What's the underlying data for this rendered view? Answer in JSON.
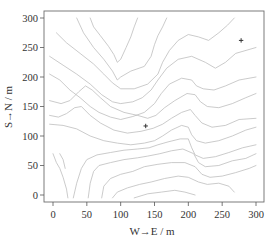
{
  "chart_data": {
    "type": "contour",
    "title": "",
    "xlabel": "W→E / m",
    "ylabel": "S→N / m",
    "xlim": [
      -12,
      310
    ],
    "ylim": [
      -12,
      312
    ],
    "xticks": [
      0,
      50,
      100,
      150,
      200,
      250,
      300
    ],
    "yticks": [
      0,
      50,
      100,
      150,
      200,
      250,
      300
    ],
    "xtick_labels": [
      "0",
      "50",
      "100",
      "150",
      "200",
      "250",
      "300"
    ],
    "ytick_labels": [
      "0",
      "50",
      "100",
      "150",
      "200",
      "250",
      "300"
    ],
    "grid": false,
    "legend": null,
    "line_color": "#b9b9b9",
    "markers": [
      {
        "symbol": "plus",
        "x": 278,
        "y": 262,
        "color": "#333333"
      },
      {
        "symbol": "plus",
        "x": 137,
        "y": 117,
        "color": "#333333"
      }
    ],
    "contours": [
      [
        [
          55,
          300
        ],
        [
          60,
          285
        ],
        [
          70,
          270
        ],
        [
          82,
          252
        ],
        [
          90,
          238
        ],
        [
          95,
          225
        ],
        [
          100,
          230
        ],
        [
          108,
          250
        ],
        [
          115,
          268
        ],
        [
          120,
          285
        ],
        [
          125,
          300
        ]
      ],
      [
        [
          35,
          300
        ],
        [
          45,
          275
        ],
        [
          60,
          250
        ],
        [
          75,
          230
        ],
        [
          88,
          210
        ],
        [
          95,
          195
        ],
        [
          100,
          200
        ],
        [
          115,
          210
        ],
        [
          135,
          218
        ],
        [
          145,
          235
        ],
        [
          150,
          255
        ],
        [
          155,
          270
        ],
        [
          162,
          285
        ],
        [
          168,
          300
        ]
      ],
      [
        [
          5,
          275
        ],
        [
          20,
          258
        ],
        [
          40,
          240
        ],
        [
          60,
          222
        ],
        [
          75,
          205
        ],
        [
          88,
          190
        ],
        [
          100,
          180
        ],
        [
          120,
          180
        ],
        [
          140,
          188
        ],
        [
          155,
          205
        ],
        [
          162,
          225
        ],
        [
          172,
          245
        ],
        [
          185,
          262
        ],
        [
          200,
          272
        ],
        [
          215,
          268
        ],
        [
          230,
          262
        ],
        [
          245,
          275
        ],
        [
          258,
          288
        ],
        [
          268,
          300
        ]
      ],
      [
        [
          -5,
          235
        ],
        [
          15,
          220
        ],
        [
          35,
          205
        ],
        [
          55,
          188
        ],
        [
          72,
          170
        ],
        [
          88,
          158
        ],
        [
          100,
          155
        ],
        [
          118,
          158
        ],
        [
          132,
          165
        ],
        [
          145,
          178
        ],
        [
          155,
          195
        ],
        [
          168,
          215
        ],
        [
          185,
          230
        ],
        [
          205,
          235
        ],
        [
          225,
          225
        ],
        [
          240,
          215
        ],
        [
          255,
          225
        ],
        [
          270,
          240
        ],
        [
          300,
          250
        ]
      ],
      [
        [
          -5,
          205
        ],
        [
          10,
          195
        ],
        [
          25,
          178
        ],
        [
          40,
          165
        ],
        [
          55,
          150
        ],
        [
          68,
          140
        ],
        [
          85,
          132
        ],
        [
          100,
          128
        ],
        [
          118,
          133
        ],
        [
          135,
          140
        ],
        [
          150,
          155
        ],
        [
          160,
          172
        ],
        [
          172,
          188
        ],
        [
          190,
          198
        ],
        [
          205,
          195
        ],
        [
          212,
          185
        ],
        [
          222,
          180
        ],
        [
          238,
          178
        ],
        [
          255,
          185
        ],
        [
          275,
          195
        ],
        [
          300,
          200
        ]
      ],
      [
        [
          -5,
          160
        ],
        [
          12,
          155
        ],
        [
          25,
          160
        ],
        [
          38,
          175
        ],
        [
          48,
          185
        ],
        [
          58,
          178
        ],
        [
          70,
          165
        ],
        [
          85,
          150
        ],
        [
          105,
          140
        ],
        [
          125,
          135
        ],
        [
          140,
          130
        ],
        [
          152,
          135
        ],
        [
          165,
          148
        ],
        [
          180,
          160
        ],
        [
          198,
          172
        ],
        [
          210,
          170
        ],
        [
          218,
          158
        ],
        [
          228,
          150
        ],
        [
          245,
          148
        ],
        [
          265,
          155
        ],
        [
          285,
          165
        ],
        [
          300,
          172
        ]
      ],
      [
        [
          -5,
          135
        ],
        [
          8,
          132
        ],
        [
          20,
          138
        ],
        [
          32,
          148
        ],
        [
          42,
          150
        ],
        [
          55,
          135
        ],
        [
          70,
          122
        ],
        [
          90,
          110
        ],
        [
          110,
          105
        ],
        [
          130,
          108
        ],
        [
          148,
          113
        ],
        [
          162,
          120
        ],
        [
          175,
          130
        ],
        [
          190,
          140
        ],
        [
          203,
          145
        ],
        [
          210,
          135
        ],
        [
          220,
          122
        ],
        [
          235,
          115
        ],
        [
          255,
          118
        ],
        [
          275,
          128
        ],
        [
          300,
          130
        ]
      ],
      [
        [
          -5,
          120
        ],
        [
          15,
          118
        ],
        [
          35,
          112
        ],
        [
          55,
          100
        ],
        [
          75,
          92
        ],
        [
          95,
          88
        ],
        [
          115,
          85
        ],
        [
          135,
          88
        ],
        [
          150,
          92
        ],
        [
          162,
          100
        ],
        [
          175,
          110
        ],
        [
          190,
          118
        ],
        [
          200,
          115
        ],
        [
          205,
          102
        ],
        [
          212,
          92
        ],
        [
          225,
          88
        ],
        [
          245,
          92
        ],
        [
          265,
          100
        ],
        [
          285,
          110
        ],
        [
          300,
          115
        ]
      ],
      [
        [
          30,
          -5
        ],
        [
          35,
          20
        ],
        [
          42,
          45
        ],
        [
          50,
          60
        ],
        [
          65,
          68
        ],
        [
          85,
          72
        ],
        [
          105,
          76
        ],
        [
          125,
          78
        ],
        [
          142,
          80
        ],
        [
          155,
          85
        ],
        [
          170,
          90
        ],
        [
          188,
          95
        ],
        [
          200,
          95
        ],
        [
          205,
          80
        ],
        [
          210,
          68
        ],
        [
          222,
          62
        ],
        [
          240,
          65
        ],
        [
          260,
          72
        ],
        [
          280,
          80
        ],
        [
          300,
          85
        ]
      ],
      [
        [
          52,
          -5
        ],
        [
          55,
          20
        ],
        [
          60,
          40
        ],
        [
          68,
          50
        ],
        [
          85,
          55
        ],
        [
          105,
          60
        ],
        [
          125,
          63
        ],
        [
          140,
          66
        ],
        [
          158,
          70
        ],
        [
          175,
          75
        ],
        [
          192,
          78
        ],
        [
          208,
          70
        ],
        [
          215,
          55
        ],
        [
          225,
          48
        ],
        [
          245,
          50
        ],
        [
          265,
          58
        ],
        [
          285,
          62
        ],
        [
          300,
          70
        ]
      ],
      [
        [
          72,
          -5
        ],
        [
          75,
          15
        ],
        [
          85,
          28
        ],
        [
          100,
          35
        ],
        [
          118,
          40
        ],
        [
          135,
          48
        ],
        [
          155,
          52
        ],
        [
          175,
          55
        ],
        [
          195,
          55
        ],
        [
          210,
          48
        ],
        [
          220,
          35
        ],
        [
          232,
          30
        ],
        [
          250,
          32
        ],
        [
          270,
          38
        ],
        [
          290,
          45
        ],
        [
          300,
          50
        ]
      ],
      [
        [
          88,
          -5
        ],
        [
          95,
          5
        ],
        [
          110,
          12
        ],
        [
          128,
          18
        ],
        [
          145,
          22
        ],
        [
          165,
          28
        ],
        [
          185,
          32
        ],
        [
          200,
          30
        ],
        [
          215,
          22
        ],
        [
          228,
          18
        ],
        [
          245,
          20
        ],
        [
          260,
          15
        ],
        [
          268,
          5
        ]
      ],
      [
        [
          120,
          -5
        ],
        [
          140,
          2
        ],
        [
          160,
          5
        ],
        [
          180,
          8
        ],
        [
          195,
          5
        ],
        [
          210,
          0
        ]
      ],
      [
        [
          0,
          70
        ],
        [
          5,
          55
        ],
        [
          10,
          45
        ],
        [
          15,
          30
        ],
        [
          20,
          10
        ],
        [
          22,
          -5
        ]
      ],
      [
        [
          10,
          70
        ],
        [
          15,
          60
        ],
        [
          18,
          45
        ]
      ]
    ]
  }
}
